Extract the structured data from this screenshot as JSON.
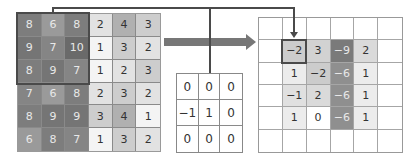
{
  "diagram": {
    "input_grid": {
      "rows": [
        [
          "8",
          "6",
          "8",
          "2",
          "4",
          "3"
        ],
        [
          "9",
          "7",
          "10",
          "1",
          "3",
          "2"
        ],
        [
          "8",
          "9",
          "7",
          "1",
          "2",
          "3"
        ],
        [
          "7",
          "6",
          "8",
          "2",
          "3",
          "2"
        ],
        [
          "8",
          "9",
          "9",
          "3",
          "4",
          "1"
        ],
        [
          "6",
          "8",
          "7",
          "1",
          "3",
          "2"
        ]
      ],
      "highlight": {
        "rows": [
          0,
          2
        ],
        "cols": [
          0,
          2
        ]
      }
    },
    "kernel": {
      "rows": [
        [
          "0",
          "0",
          "0"
        ],
        [
          "-1",
          "1",
          "0"
        ],
        [
          "0",
          "0",
          "0"
        ]
      ]
    },
    "output_grid": {
      "rows": [
        [
          "",
          "",
          "",
          "",
          "",
          ""
        ],
        [
          "",
          "-2",
          "3",
          "-9",
          "2",
          ""
        ],
        [
          "",
          "1",
          "-2",
          "-6",
          "1",
          ""
        ],
        [
          "",
          "-1",
          "2",
          "-6",
          "1",
          ""
        ],
        [
          "",
          "1",
          "0",
          "-6",
          "1",
          ""
        ],
        [
          "",
          "",
          "",
          "",
          "",
          ""
        ]
      ],
      "highlight": {
        "row": 1,
        "col": 1
      }
    },
    "colors": {
      "input": {
        "1": "#f4f4f4",
        "2": "#e2e2e2",
        "3": "#cdcdcd",
        "4": "#b0b0b0",
        "6": "#9a9a9a",
        "7": "#858585",
        "8": "#7d7d7d",
        "9": "#757575",
        "10": "#6a6a6a"
      },
      "output": {
        "-9": "#7a7a7a",
        "-6": "#8f8f8f",
        "-2": "#cccccc",
        "-1": "#e0e0e0",
        "0": "#ffffff",
        "1": "#ececec",
        "2": "#dadada",
        "3": "#d2d2d2",
        "": "#ffffff"
      },
      "arrow": "#777777",
      "connector": "#4a4a4a"
    }
  }
}
